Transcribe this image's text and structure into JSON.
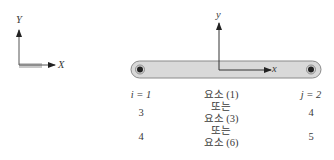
{
  "global_axes": {
    "x_label": "X",
    "y_label": "Y"
  },
  "local_axes": {
    "x_label": "x",
    "y_label": "y"
  },
  "element_bar": {
    "fill": "#d9d9d9",
    "stroke": "#8a8a8a"
  },
  "table": {
    "rows": [
      {
        "left": "i = 1",
        "middle": "요소 (1)",
        "right": "j = 2"
      },
      {
        "left": "",
        "middle": "또는",
        "right": ""
      },
      {
        "left": "3",
        "middle": "요소 (3)",
        "right": "4"
      },
      {
        "left": "",
        "middle": "또는",
        "right": ""
      },
      {
        "left": "4",
        "middle": "요소 (6)",
        "right": "5"
      }
    ]
  }
}
